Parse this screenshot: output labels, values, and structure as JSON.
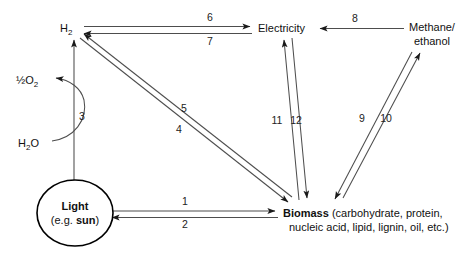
{
  "diagram": {
    "background_color": "#ffffff",
    "line_color": "#4d4d4d",
    "text_color": "#111111",
    "nodes": [
      {
        "id": "hydrogen",
        "label": "H",
        "subscript": "2",
        "x": 68,
        "y": 28
      },
      {
        "id": "half-oxygen",
        "label_prefix": "½O",
        "subscript": "2",
        "x": 30,
        "y": 80
      },
      {
        "id": "water",
        "label": "H",
        "subscript": "2",
        "label_suffix": "O",
        "x": 32,
        "y": 143
      },
      {
        "id": "light",
        "line1": "Light",
        "line2_prefix": "(e.g. ",
        "line2_bold": "sun",
        "line2_suffix": ")",
        "cx": 75,
        "cy": 213,
        "rx": 38,
        "ry": 33
      },
      {
        "id": "electricity",
        "label": "Electricity",
        "x": 258,
        "y": 28
      },
      {
        "id": "methane-ethanol",
        "line1": "Methane/",
        "line2": "ethanol",
        "x": 432,
        "y": 27
      },
      {
        "id": "biomass",
        "bold": "Biomass",
        "line1_rest": " (carbohydrate, protein,",
        "line2": "nucleic acid, lipid, lignin, oil, etc.)",
        "x": 283,
        "y": 214
      }
    ],
    "edges": [
      {
        "id": "edge-1",
        "number": "1",
        "from": "light",
        "to": "biomass",
        "label_x": 185,
        "label_y": 205
      },
      {
        "id": "edge-2",
        "number": "2",
        "from": "biomass",
        "to": "light",
        "label_x": 185,
        "label_y": 228
      },
      {
        "id": "edge-3",
        "number": "3",
        "from": "light",
        "to": "hydrogen",
        "label_x": 82,
        "label_y": 120
      },
      {
        "id": "edge-4",
        "number": "4",
        "from": "biomass",
        "to": "hydrogen",
        "label_x": 179,
        "label_y": 133
      },
      {
        "id": "edge-5",
        "number": "5",
        "from": "hydrogen",
        "to": "biomass",
        "label_x": 184,
        "label_y": 112
      },
      {
        "id": "edge-6",
        "number": "6",
        "from": "hydrogen",
        "to": "electricity",
        "label_x": 210,
        "label_y": 21
      },
      {
        "id": "edge-7",
        "number": "7",
        "from": "electricity",
        "to": "hydrogen",
        "label_x": 210,
        "label_y": 44
      },
      {
        "id": "edge-8",
        "number": "8",
        "from": "methane-ethanol",
        "to": "electricity",
        "label_x": 355,
        "label_y": 22
      },
      {
        "id": "edge-9",
        "number": "9",
        "from": "methane-ethanol",
        "to": "biomass",
        "label_x": 362,
        "label_y": 122
      },
      {
        "id": "edge-10",
        "number": "10",
        "from": "biomass",
        "to": "methane-ethanol",
        "label_x": 386,
        "label_y": 122
      },
      {
        "id": "edge-11",
        "number": "11",
        "from": "biomass",
        "to": "electricity",
        "label_x": 277,
        "label_y": 124
      },
      {
        "id": "edge-12",
        "number": "12",
        "from": "electricity",
        "to": "biomass",
        "label_x": 296,
        "label_y": 124
      },
      {
        "id": "edge-water-oxygen",
        "number": "",
        "from": "water",
        "to": "half-oxygen",
        "label_x": 0,
        "label_y": 0
      }
    ]
  }
}
